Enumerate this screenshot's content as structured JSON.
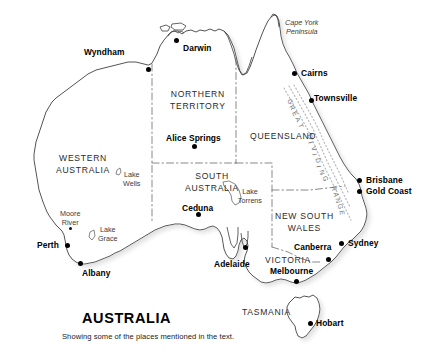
{
  "figure": {
    "title": "AUSTRALIA",
    "caption": "Showing some of the places mentioned in the text."
  },
  "states": [
    {
      "name": "western-australia",
      "lines": [
        "WESTERN",
        "AUSTRALIA"
      ],
      "x": 56,
      "y": 152
    },
    {
      "name": "northern-territory",
      "lines": [
        "NORTHERN",
        "TERRITORY"
      ],
      "x": 170,
      "y": 88
    },
    {
      "name": "south-australia",
      "lines": [
        "SOUTH",
        "AUSTRALIA"
      ],
      "x": 185,
      "y": 170
    },
    {
      "name": "queensland",
      "lines": [
        "QUEENSLAND"
      ],
      "x": 250,
      "y": 132
    },
    {
      "name": "new-south-wales",
      "lines": [
        "NEW   SOUTH",
        "WALES"
      ],
      "x": 275,
      "y": 210
    },
    {
      "name": "victoria",
      "lines": [
        "VICTORIA"
      ],
      "x": 265,
      "y": 256
    },
    {
      "name": "tasmania",
      "lines": [
        "TASMANIA"
      ],
      "x": 242,
      "y": 308
    }
  ],
  "cities": [
    {
      "name": "wyndham",
      "label": "Wyndham",
      "dot_x": 148,
      "dot_y": 69,
      "lbl_x": 84,
      "lbl_y": 48,
      "anchor": "left"
    },
    {
      "name": "darwin",
      "label": "Darwin",
      "dot_x": 176,
      "dot_y": 40,
      "lbl_x": 183,
      "lbl_y": 44,
      "anchor": "right"
    },
    {
      "name": "cairns",
      "label": "Cairns",
      "dot_x": 294,
      "dot_y": 73,
      "lbl_x": 301,
      "lbl_y": 69,
      "anchor": "right"
    },
    {
      "name": "townsville",
      "label": "Townsville",
      "dot_x": 311,
      "dot_y": 100,
      "lbl_x": 314,
      "lbl_y": 94,
      "anchor": "right"
    },
    {
      "name": "brisbane",
      "label": "Brisbane",
      "dot_x": 359,
      "dot_y": 180,
      "lbl_x": 366,
      "lbl_y": 176,
      "anchor": "right"
    },
    {
      "name": "gold-coast",
      "label": "Gold Coast",
      "dot_x": 359,
      "dot_y": 191,
      "lbl_x": 366,
      "lbl_y": 187,
      "anchor": "right"
    },
    {
      "name": "sydney",
      "label": "Sydney",
      "dot_x": 341,
      "dot_y": 243,
      "lbl_x": 348,
      "lbl_y": 239,
      "anchor": "right"
    },
    {
      "name": "canberra",
      "label": "Canberra",
      "dot_x": 328,
      "dot_y": 259,
      "lbl_x": 294,
      "lbl_y": 243,
      "anchor": "right"
    },
    {
      "name": "melbourne",
      "label": "Melbourne",
      "dot_x": 296,
      "dot_y": 281,
      "lbl_x": 270,
      "lbl_y": 267,
      "anchor": "right"
    },
    {
      "name": "hobart",
      "label": "Hobart",
      "dot_x": 310,
      "dot_y": 323,
      "lbl_x": 316,
      "lbl_y": 319,
      "anchor": "right"
    },
    {
      "name": "adelaide",
      "label": "Adelaide",
      "dot_x": 245,
      "dot_y": 247,
      "lbl_x": 214,
      "lbl_y": 260,
      "anchor": "right"
    },
    {
      "name": "ceduna",
      "label": "Ceduna",
      "dot_x": 198,
      "dot_y": 214,
      "lbl_x": 182,
      "lbl_y": 204,
      "anchor": "right"
    },
    {
      "name": "alice-springs",
      "label": "Alice Springs",
      "dot_x": 194,
      "dot_y": 146,
      "lbl_x": 166,
      "lbl_y": 134,
      "anchor": "right"
    },
    {
      "name": "perth",
      "label": "Perth",
      "dot_x": 67,
      "dot_y": 245,
      "lbl_x": 37,
      "lbl_y": 241,
      "anchor": "right"
    },
    {
      "name": "albany",
      "label": "Albany",
      "dot_x": 80,
      "dot_y": 263,
      "lbl_x": 82,
      "lbl_y": 269,
      "anchor": "right"
    }
  ],
  "features": [
    {
      "name": "cape-york-peninsula",
      "lines": [
        "Cape York",
        "Peninsula"
      ],
      "x": 285,
      "y": 18,
      "italic": true,
      "dot": false
    },
    {
      "name": "lake-wells",
      "lines": [
        "Lake",
        "Wells"
      ],
      "x": 123,
      "y": 170,
      "italic": false,
      "dot": false
    },
    {
      "name": "lake-torrens",
      "lines": [
        "Lake",
        "Torrens"
      ],
      "x": 238,
      "y": 187,
      "italic": false,
      "dot": false
    },
    {
      "name": "lake-grace",
      "lines": [
        "Lake",
        "Grace"
      ],
      "x": 98,
      "y": 225,
      "italic": false,
      "dot": false
    },
    {
      "name": "moore-river",
      "lines": [
        "Moore",
        "River"
      ],
      "x": 60,
      "y": 209,
      "italic": false,
      "dot": true,
      "dot_x": 70,
      "dot_y": 228
    }
  ],
  "range_label": {
    "name": "great-dividing-range",
    "text": "GREAT DIVIDING RANGE",
    "letters": [
      {
        "ch": "G",
        "x": 288,
        "y": 98,
        "rot": 58
      },
      {
        "ch": "R",
        "x": 290,
        "y": 104,
        "rot": 60
      },
      {
        "ch": "E",
        "x": 293,
        "y": 110,
        "rot": 62
      },
      {
        "ch": "A",
        "x": 296,
        "y": 116,
        "rot": 64
      },
      {
        "ch": "T",
        "x": 299,
        "y": 122,
        "rot": 66
      },
      {
        "ch": "D",
        "x": 308,
        "y": 133,
        "rot": 72
      },
      {
        "ch": "I",
        "x": 310,
        "y": 139,
        "rot": 74
      },
      {
        "ch": "V",
        "x": 312,
        "y": 145,
        "rot": 76
      },
      {
        "ch": "I",
        "x": 314,
        "y": 151,
        "rot": 78
      },
      {
        "ch": "D",
        "x": 316,
        "y": 157,
        "rot": 80
      },
      {
        "ch": "I",
        "x": 318,
        "y": 163,
        "rot": 80
      },
      {
        "ch": "N",
        "x": 320,
        "y": 169,
        "rot": 80
      },
      {
        "ch": "G",
        "x": 323,
        "y": 175,
        "rot": 80
      },
      {
        "ch": "R",
        "x": 332,
        "y": 185,
        "rot": 82
      },
      {
        "ch": "A",
        "x": 334,
        "y": 191,
        "rot": 82
      },
      {
        "ch": "N",
        "x": 336,
        "y": 197,
        "rot": 82
      },
      {
        "ch": "G",
        "x": 338,
        "y": 203,
        "rot": 82
      },
      {
        "ch": "E",
        "x": 340,
        "y": 209,
        "rot": 82
      }
    ]
  },
  "colors": {
    "coastline": "#3d3d3d",
    "border": "#6b6b6b",
    "land": "#ffffff",
    "shadow": "#d8d8d8",
    "dot": "#000000",
    "text": "#1a1a1a"
  }
}
